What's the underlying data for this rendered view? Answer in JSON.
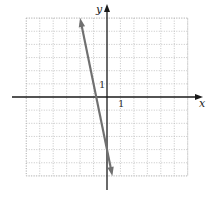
{
  "chart_data": {
    "type": "line",
    "title": "",
    "xlabel": "x",
    "ylabel": "y",
    "xlim": [
      -6,
      6
    ],
    "ylim": [
      -6,
      6
    ],
    "grid": true,
    "grid_step": 1,
    "tick_labels": {
      "x": [
        "1"
      ],
      "y": [
        "1"
      ]
    },
    "series": [
      {
        "name": "line",
        "equation": "y = -5x - 4",
        "slope": -5,
        "y_intercept": -4,
        "x_intercept": -0.8,
        "x": [
          -2,
          0.4
        ],
        "y": [
          6,
          -6
        ],
        "arrows": "both",
        "color": "#707070"
      }
    ],
    "legend": null
  },
  "labels": {
    "x_axis": "x",
    "y_axis": "y",
    "x_tick_one": "1",
    "y_tick_one": "1"
  },
  "colors": {
    "axis": "#1a1a1a",
    "grid": "#b8b8b8",
    "line": "#707070"
  }
}
